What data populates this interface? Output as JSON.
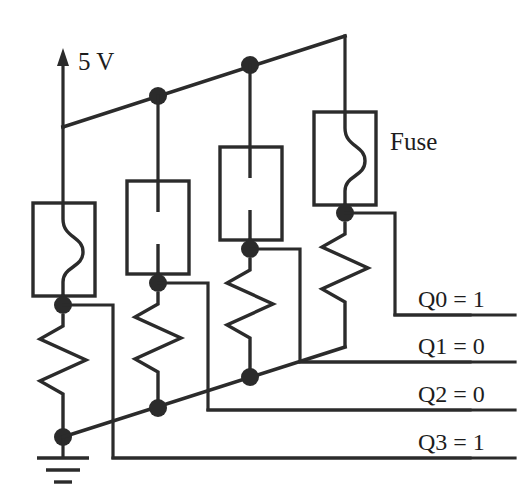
{
  "diagram": {
    "type": "circuit-schematic",
    "colors": {
      "ink": "#2b2b2b",
      "text": "#1d1d1d",
      "background": "#ffffff"
    },
    "supply": {
      "label": "5 V",
      "symbol": "up-arrow"
    },
    "fuse_annotation": {
      "label": "Fuse"
    },
    "ground": {
      "symbol": "earth-ground",
      "label": ""
    },
    "columns": [
      {
        "id": "col0",
        "fuse_state": "intact",
        "output": "Q3",
        "value": "1"
      },
      {
        "id": "col1",
        "fuse_state": "blown",
        "output": "Q2",
        "value": "0"
      },
      {
        "id": "col2",
        "fuse_state": "blown",
        "output": "Q1",
        "value": "0"
      },
      {
        "id": "col3",
        "fuse_state": "intact",
        "output": "Q0",
        "value": "1"
      }
    ],
    "outputs": [
      {
        "name": "Q0",
        "value": "1",
        "text": "Q0 = 1"
      },
      {
        "name": "Q1",
        "value": "0",
        "text": "Q1 = 0"
      },
      {
        "name": "Q2",
        "value": "0",
        "text": "Q2 = 0"
      },
      {
        "name": "Q3",
        "value": "1",
        "text": "Q3 = 1"
      }
    ]
  }
}
